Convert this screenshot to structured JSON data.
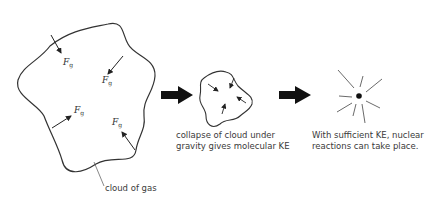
{
  "diagram": {
    "stages": [
      {
        "name": "cloud-of-gas",
        "label": "cloud of gas",
        "forces": [
          {
            "symbol": "F",
            "subscript": "g"
          },
          {
            "symbol": "F",
            "subscript": "g"
          },
          {
            "symbol": "F",
            "subscript": "g"
          },
          {
            "symbol": "F",
            "subscript": "g"
          }
        ]
      },
      {
        "name": "collapsed-cloud",
        "caption_line1": "collapse of cloud under",
        "caption_line2": "gravity gives molecular KE"
      },
      {
        "name": "nuclear-reactions",
        "caption_line1": "With sufficient KE, nuclear",
        "caption_line2": "reactions can take place."
      }
    ],
    "colors": {
      "line": "#333333",
      "arrow_fill": "#111111",
      "text": "#3a3a3a"
    }
  }
}
